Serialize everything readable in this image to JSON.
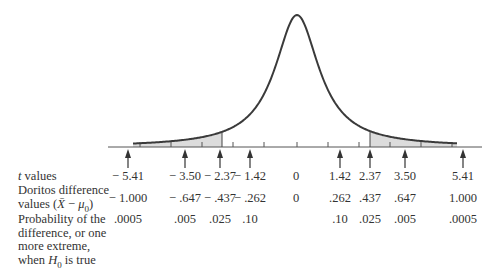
{
  "chart_data": {
    "type": "area",
    "title": "",
    "xlabel": "",
    "ylabel": "",
    "grid": false,
    "legend": null,
    "shaded_regions": [
      {
        "from_t": "-inf",
        "to_t": -2.37,
        "color": "#dcdcdc"
      },
      {
        "from_t": 2.37,
        "to_t": "inf",
        "color": "#dcdcdc"
      }
    ],
    "columns": [
      {
        "t": "− 5.41",
        "diff": "− 1.000",
        "prob": ".0005",
        "x": 128,
        "arrow": true
      },
      {
        "t": "− 3.50",
        "diff": "− .647",
        "prob": ".005",
        "x": 185,
        "arrow": true
      },
      {
        "t": "− 2.37",
        "diff": "− .437",
        "prob": ".025",
        "x": 220,
        "arrow": true
      },
      {
        "t": "− 1.42",
        "diff": "− .262",
        "prob": ".10",
        "x": 250,
        "arrow": true
      },
      {
        "t": "0",
        "diff": "0",
        "prob": "",
        "x": 296,
        "arrow": false
      },
      {
        "t": "1.42",
        "diff": ".262",
        "prob": ".10",
        "x": 340,
        "arrow": true
      },
      {
        "t": "2.37",
        "diff": ".437",
        "prob": ".025",
        "x": 370,
        "arrow": true
      },
      {
        "t": "3.50",
        "diff": ".647",
        "prob": ".005",
        "x": 405,
        "arrow": true
      },
      {
        "t": "5.41",
        "diff": "1.000",
        "prob": ".0005",
        "x": 463,
        "arrow": true
      }
    ],
    "t_values": [
      -5.41,
      -3.5,
      -2.37,
      -1.42,
      0,
      1.42,
      2.37,
      3.5,
      5.41
    ],
    "difference_values": [
      -1.0,
      -0.647,
      -0.437,
      -0.262,
      0,
      0.262,
      0.437,
      0.647,
      1.0
    ],
    "probabilities": [
      0.0005,
      0.005,
      0.025,
      0.1,
      null,
      0.1,
      0.025,
      0.005,
      0.0005
    ],
    "row_labels": {
      "t": "t values",
      "diff_line1": "Doritos difference",
      "diff_line2": "values (X̄ − μ0)",
      "prob_lines": [
        "Probability of the",
        "difference, or one",
        "more extreme,",
        "when H0 is true"
      ]
    }
  },
  "labels": {
    "t_row_italic": "t",
    "t_row_rest": " values",
    "diff_line1": "Doritos difference",
    "diff_line2_pre": "values (",
    "diff_xbar": "X̄",
    "diff_minus": " − ",
    "diff_mu": "μ",
    "diff_sub": "0",
    "diff_close": ")",
    "prob_line1": "Probability of the",
    "prob_line2": "difference, or one",
    "prob_line3": "more extreme,",
    "prob_line4_pre": "when ",
    "prob_line4_H": "H",
    "prob_line4_sub": "0",
    "prob_line4_post": " is true"
  },
  "colors": {
    "curve": "#3a3a3a",
    "axis": "#555555",
    "shade": "#dcdcdc"
  }
}
